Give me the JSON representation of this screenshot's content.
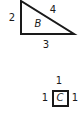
{
  "shapes": {
    "triangle": {
      "name": "B",
      "sides": {
        "left": "2",
        "hypotenuse": "4",
        "bottom": "3"
      }
    },
    "square": {
      "name": "C",
      "sides": {
        "top": "1",
        "left": "1",
        "right": "1"
      }
    }
  },
  "colors": {
    "stroke": "#1a1a1a",
    "background": "#ffffff"
  }
}
